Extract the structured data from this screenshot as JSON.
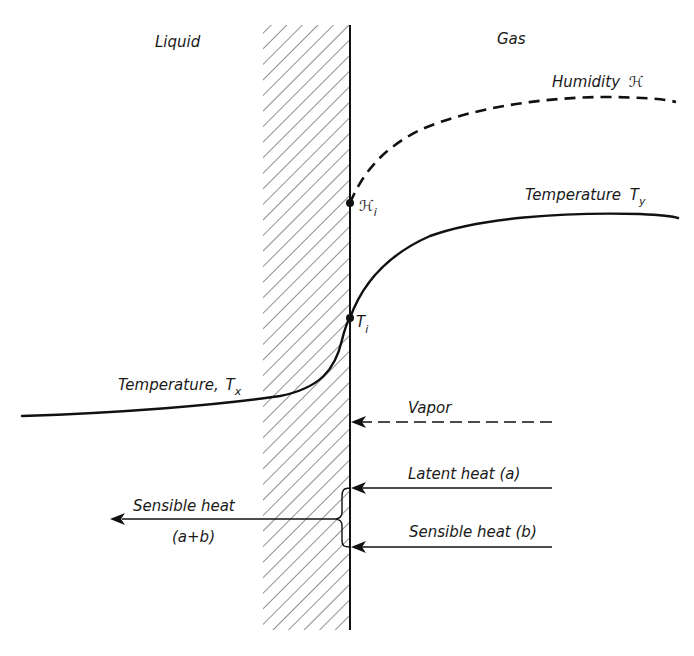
{
  "diagram": {
    "regions": {
      "liquid_label": "Liquid",
      "gas_label": "Gas"
    },
    "curves": {
      "humidity_label": "Humidity",
      "humidity_symbol": "ℋ",
      "gas_temperature_label": "Temperature",
      "gas_temperature_symbol": "T",
      "gas_temperature_subscript": "y",
      "liquid_temperature_label": "Temperature,",
      "liquid_temperature_symbol": "T",
      "liquid_temperature_subscript": "x"
    },
    "interface_points": {
      "humidity_point_symbol": "ℋ",
      "humidity_point_subscript": "i",
      "temperature_point_symbol": "T",
      "temperature_point_subscript": "i"
    },
    "fluxes": {
      "vapor_label": "Vapor",
      "latent_heat_label": "Latent heat (a)",
      "sensible_heat_b_label": "Sensible heat (b)",
      "sensible_heat_total_label": "Sensible heat",
      "sensible_heat_total_sum": "(a+b)"
    },
    "colors": {
      "ink": "#111111",
      "background": "#ffffff"
    }
  }
}
